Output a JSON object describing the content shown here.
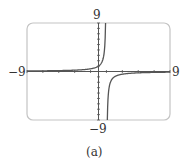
{
  "chart_data": {
    "type": "line",
    "title": "",
    "caption": "(a)",
    "function_description": "rational function with vertical asymptote near x = 1 and horizontal asymptote y = 0; negative-reciprocal shape",
    "xlim": [
      -9,
      9
    ],
    "ylim": [
      -9,
      9
    ],
    "xtick_labels": {
      "min": "−9",
      "max": "9"
    },
    "ytick_labels": {
      "min": "−9",
      "max": "9"
    },
    "vertical_asymptote_x": 1,
    "horizontal_asymptote_y": 0,
    "grid": false,
    "series": [
      {
        "name": "left branch",
        "x": [
          -9,
          -5,
          -3,
          -2,
          -1,
          0,
          0.5,
          0.8,
          0.9
        ],
        "y": [
          0.1,
          0.17,
          0.25,
          0.33,
          0.5,
          1,
          2,
          5,
          9
        ]
      },
      {
        "name": "right branch",
        "x": [
          1.1,
          1.2,
          1.5,
          2,
          3,
          5,
          9
        ],
        "y": [
          -9,
          -5,
          -2,
          -1,
          -0.5,
          -0.25,
          -0.125
        ]
      }
    ]
  },
  "labels": {
    "top": "9",
    "bottom": "−9",
    "left": "−9",
    "right": "9",
    "caption": "(a)"
  },
  "colors": {
    "frame": "#bdbdbd",
    "axis": "#555555",
    "curve": "#555555"
  }
}
